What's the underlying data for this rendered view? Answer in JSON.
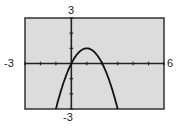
{
  "window": {
    "xmin": "-3",
    "xmax": "6",
    "ymax": "3",
    "ymin": "-3"
  },
  "colors": {
    "screen_bg": "#dcdcdc",
    "axis": "#222222",
    "curve": "#111111",
    "frame": "#333333"
  },
  "chart_data": {
    "type": "line",
    "title": "",
    "xlabel": "",
    "ylabel": "",
    "xlim": [
      -3,
      6
    ],
    "ylim": [
      -3,
      3
    ],
    "xscale": 1,
    "yscale": 1,
    "grid": false,
    "series": [
      {
        "name": "y = -x^2 + 2x",
        "x": [
          -1,
          -0.5,
          0,
          0.5,
          1,
          1.5,
          2,
          2.5,
          3
        ],
        "y": [
          -3,
          -1.25,
          0,
          0.75,
          1,
          0.75,
          0,
          -1.25,
          -3
        ]
      }
    ],
    "annotations": [
      "-3 (xmin)",
      "6 (xmax)",
      "3 (ymax)",
      "-3 (ymin)"
    ]
  }
}
